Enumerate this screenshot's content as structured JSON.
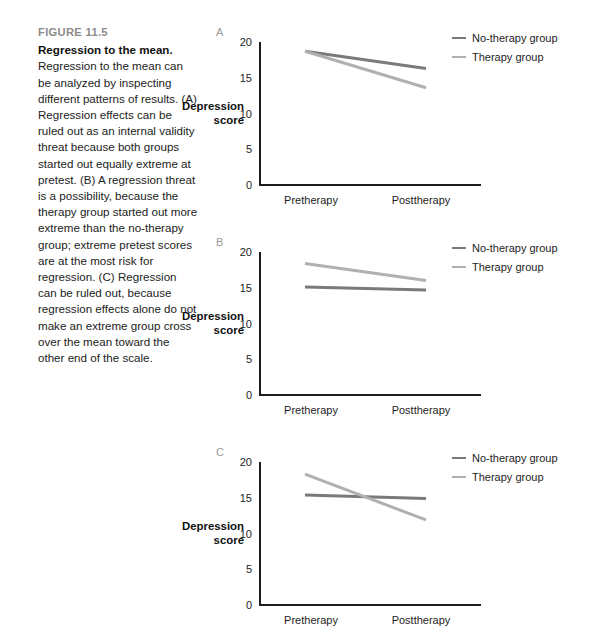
{
  "figure": {
    "number": "FIGURE 11.5",
    "title": "Regression to the mean.",
    "caption": " Regression to the mean can be analyzed by inspecting different patterns of results. (A) Regression effects can be ruled out as an internal validity threat because both groups started out equally extreme at pretest. (B) A regression threat is a possibility, because the therapy group started out more extreme than the no-therapy group; extreme pretest scores are at the most risk for regression. (C) Regression can be ruled out, because regression effects alone do not make an extreme group cross over the mean toward the other end of the scale."
  },
  "colors": {
    "no_therapy": "#7a7a7a",
    "therapy": "#b0b0b0",
    "axis": "#1d1d1d",
    "figure_number": "#8b8b8b",
    "panel_letter": "#9a9a9a"
  },
  "legend": {
    "no_therapy_label": "No-therapy group",
    "therapy_label": "Therapy group"
  },
  "axis": {
    "y_title_line1": "Depression",
    "y_title_line2": "score",
    "y_ticks": [
      "20",
      "15",
      "10",
      "5",
      "0"
    ],
    "x_pre": "Pretherapy",
    "x_post": "Posttherapy"
  },
  "panels": [
    {
      "letter": "A"
    },
    {
      "letter": "B"
    },
    {
      "letter": "C"
    }
  ],
  "chart_data": [
    {
      "type": "line",
      "panel": "A",
      "title": "",
      "xlabel": "",
      "ylabel": "Depression score",
      "categories": [
        "Pretherapy",
        "Posttherapy"
      ],
      "ylim": [
        0,
        20
      ],
      "yticks": [
        0,
        5,
        10,
        15,
        20
      ],
      "grid": false,
      "legend_position": "top-right",
      "series": [
        {
          "name": "No-therapy group",
          "values": [
            18.7,
            16.3
          ],
          "color": "#7a7a7a"
        },
        {
          "name": "Therapy group",
          "values": [
            18.7,
            13.6
          ],
          "color": "#b0b0b0"
        }
      ],
      "note": "Both groups start equally extreme at pretest; regression effects ruled out."
    },
    {
      "type": "line",
      "panel": "B",
      "title": "",
      "xlabel": "",
      "ylabel": "Depression score",
      "categories": [
        "Pretherapy",
        "Posttherapy"
      ],
      "ylim": [
        0,
        20
      ],
      "yticks": [
        0,
        5,
        10,
        15,
        20
      ],
      "grid": false,
      "legend_position": "top-right",
      "series": [
        {
          "name": "No-therapy group",
          "values": [
            15.1,
            14.7
          ],
          "color": "#7a7a7a"
        },
        {
          "name": "Therapy group",
          "values": [
            18.4,
            16.0
          ],
          "color": "#b0b0b0"
        }
      ],
      "note": "Therapy group started more extreme; regression threat is a possibility."
    },
    {
      "type": "line",
      "panel": "C",
      "title": "",
      "xlabel": "",
      "ylabel": "Depression score",
      "categories": [
        "Pretherapy",
        "Posttherapy"
      ],
      "ylim": [
        0,
        20
      ],
      "yticks": [
        0,
        5,
        10,
        15,
        20
      ],
      "grid": false,
      "legend_position": "top-right",
      "series": [
        {
          "name": "No-therapy group",
          "values": [
            15.4,
            14.9
          ],
          "color": "#7a7a7a"
        },
        {
          "name": "Therapy group",
          "values": [
            18.3,
            11.9
          ],
          "color": "#b0b0b0"
        }
      ],
      "note": "Extreme group crosses over the mean; regression ruled out."
    }
  ]
}
